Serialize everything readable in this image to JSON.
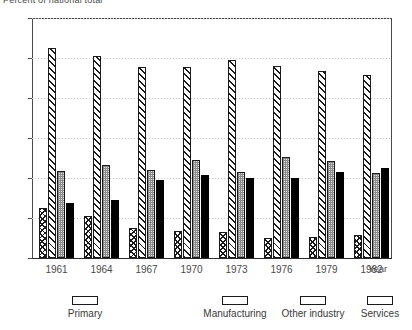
{
  "chart_data": {
    "type": "bar",
    "title": "Percent of national total",
    "xlabel": "Year",
    "ylabel": "",
    "categories": [
      "1961",
      "1964",
      "1967",
      "1970",
      "1973",
      "1976",
      "1979",
      "1982"
    ],
    "ylim": [
      0,
      60
    ],
    "yticks": [
      0,
      10,
      20,
      30,
      40,
      50,
      60
    ],
    "grid": true,
    "legend_position": "bottom",
    "series": [
      {
        "name": "Primary",
        "values": [
          12.5,
          10.5,
          7.5,
          6.7,
          6.5,
          5.0,
          5.3,
          5.8
        ]
      },
      {
        "name": "Manufacturing",
        "values": [
          52.5,
          50.5,
          47.8,
          47.8,
          49.5,
          48.0,
          46.8,
          45.8
        ]
      },
      {
        "name": "Other industry",
        "values": [
          21.8,
          23.3,
          22.0,
          24.5,
          21.5,
          25.3,
          24.3,
          21.3
        ]
      },
      {
        "name": "Services",
        "values": [
          13.8,
          14.5,
          19.5,
          20.8,
          20.0,
          20.0,
          21.5,
          22.5
        ]
      }
    ]
  },
  "legend": {
    "items": [
      {
        "label": "Primary",
        "pattern": "diagonal-cross-hatch-swatch"
      },
      {
        "label": "Manufacturing",
        "pattern": "diagonal-hatch-swatch"
      },
      {
        "label": "Other industry",
        "pattern": "stipple-swatch"
      },
      {
        "label": "Services",
        "pattern": "solid-black-swatch"
      }
    ]
  }
}
